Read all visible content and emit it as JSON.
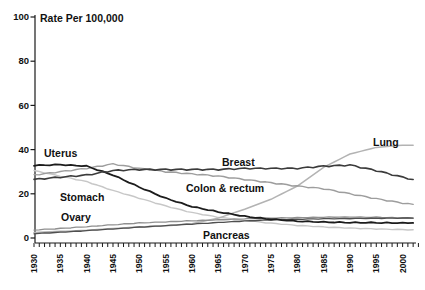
{
  "chart_data": {
    "type": "line",
    "title": "Rate Per 100,000",
    "xlabel": "",
    "ylabel": "",
    "xlim": [
      1930,
      2003
    ],
    "ylim": [
      0,
      100
    ],
    "yticks": [
      0,
      20,
      40,
      60,
      80,
      100
    ],
    "x_label_ticks": [
      1930,
      1935,
      1940,
      1945,
      1950,
      1955,
      1960,
      1965,
      1970,
      1975,
      1980,
      1985,
      1990,
      1995,
      2000
    ],
    "x_minor_ticks": {
      "start": 1930,
      "end": 2003,
      "step": 1
    },
    "x_tick_label_rotation": -90,
    "grid": false,
    "legend_position": "inline-labels",
    "axis_color": "#1a1a1a",
    "x": [
      1930,
      1935,
      1940,
      1945,
      1950,
      1955,
      1960,
      1965,
      1970,
      1975,
      1980,
      1985,
      1990,
      1995,
      2000,
      2002
    ],
    "series": [
      {
        "name": "Stomach",
        "color": "#c7c7c7",
        "width": 1.4,
        "wavy": 0.15,
        "label": {
          "text": "Stomach",
          "x": 60,
          "y": 201
        },
        "values": [
          30.5,
          28,
          25.5,
          21.5,
          18,
          14.5,
          11.5,
          9.4,
          7.9,
          6.7,
          5.7,
          5,
          4.5,
          4.1,
          3.8,
          3.7
        ]
      },
      {
        "name": "Lung",
        "color": "#b3b3b3",
        "width": 1.5,
        "wavy": 0,
        "label": {
          "text": "Lung",
          "x": 373,
          "y": 146
        },
        "values": [
          2.5,
          3,
          3.5,
          4.3,
          5,
          5.5,
          6.5,
          9,
          13,
          17.5,
          23.5,
          32,
          38,
          41,
          42,
          42
        ]
      },
      {
        "name": "Colon & rectum",
        "color": "#9d9d9d",
        "width": 1.4,
        "wavy": 0.25,
        "label": {
          "text": "Colon & rectum",
          "x": 186,
          "y": 192
        },
        "values": [
          28.5,
          30,
          31.5,
          33.5,
          31.5,
          30,
          29,
          28,
          26.5,
          25,
          23.5,
          22.3,
          20,
          17.8,
          15.8,
          15.2
        ]
      },
      {
        "name": "Ovary",
        "color": "#8f8f8f",
        "width": 1.3,
        "wavy": 0.12,
        "label": {
          "text": "Ovary",
          "x": 61,
          "y": 221
        },
        "values": [
          3.6,
          4.3,
          5.1,
          6,
          6.8,
          7.3,
          7.8,
          8.2,
          8.7,
          9,
          9.2,
          9.4,
          9.5,
          9.4,
          9.1,
          9
        ]
      },
      {
        "name": "Pancreas",
        "color": "#4f4f4f",
        "width": 1.3,
        "wavy": 0.1,
        "label": {
          "text": "Pancreas",
          "x": 203,
          "y": 239
        },
        "values": [
          2,
          2.6,
          3.3,
          4.1,
          4.9,
          5.6,
          6.3,
          7,
          7.7,
          8.2,
          8.5,
          8.7,
          8.8,
          8.9,
          9,
          9
        ]
      },
      {
        "name": "Uterus",
        "color": "#1c1c1c",
        "width": 1.8,
        "wavy": 0.2,
        "label": {
          "text": "Uterus",
          "x": 44,
          "y": 157
        },
        "values": [
          32.8,
          33.2,
          32.5,
          28.5,
          23,
          18,
          14.2,
          11.8,
          9.8,
          8.5,
          7.6,
          7.2,
          7,
          6.9,
          6.8,
          6.8
        ]
      },
      {
        "name": "Breast",
        "color": "#3b3b3b",
        "width": 1.6,
        "wavy": 0.3,
        "label": {
          "text": "Breast",
          "x": 222,
          "y": 166
        },
        "values": [
          26.5,
          27.5,
          28.5,
          30.5,
          31,
          31,
          31,
          31,
          31.5,
          31.5,
          31.5,
          32.5,
          33,
          30.5,
          27.5,
          26.5
        ]
      }
    ]
  }
}
